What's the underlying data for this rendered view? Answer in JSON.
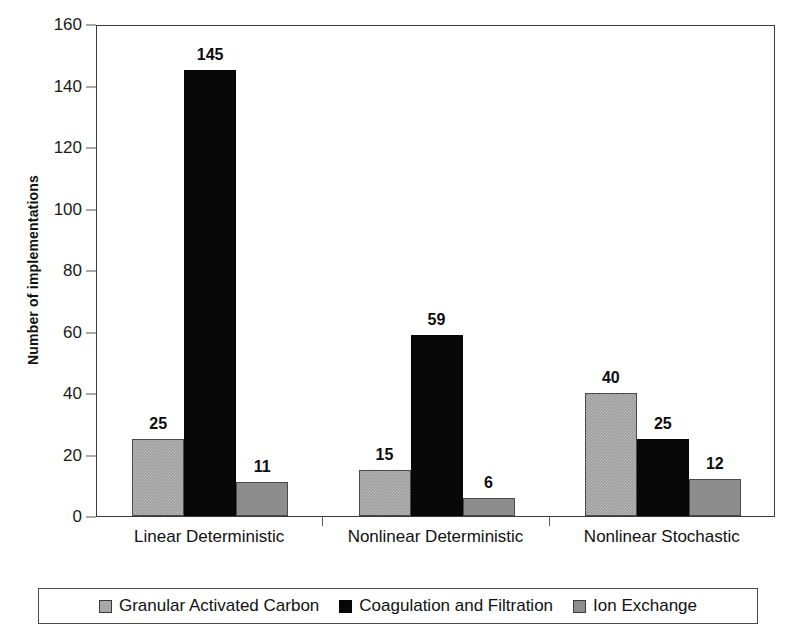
{
  "chart_data": {
    "type": "bar",
    "title": "",
    "xlabel": "",
    "ylabel": "Number of implementations",
    "ylim": [
      0,
      160
    ],
    "ytick_step": 20,
    "yticks": [
      "160",
      "140",
      "120",
      "100",
      "80",
      "60",
      "40",
      "20",
      "0"
    ],
    "grid": false,
    "legend_position": "bottom",
    "categories": [
      "Linear Deterministic",
      "Nonlinear Deterministic",
      "Nonlinear Stochastic"
    ],
    "series": [
      {
        "name": "Granular Activated Carbon",
        "color": "#9b9b9b",
        "values": [
          25,
          15,
          40
        ],
        "labels": [
          "25",
          "15",
          "40"
        ]
      },
      {
        "name": "Coagulation and Filtration",
        "color": "#080808",
        "values": [
          145,
          59,
          25
        ],
        "labels": [
          "145",
          "59",
          "25"
        ]
      },
      {
        "name": "Ion Exchange",
        "color": "#8d8d8d",
        "values": [
          11,
          6,
          12
        ],
        "labels": [
          "11",
          "6",
          "12"
        ]
      }
    ]
  },
  "axes": {
    "y_title": "Number of implementations"
  },
  "legend": {
    "items": [
      {
        "label": "Granular Activated Carbon",
        "swatch": "series-gac"
      },
      {
        "label": "Coagulation and Filtration",
        "swatch": "series-coag"
      },
      {
        "label": "Ion Exchange",
        "swatch": "series-ion"
      }
    ]
  }
}
